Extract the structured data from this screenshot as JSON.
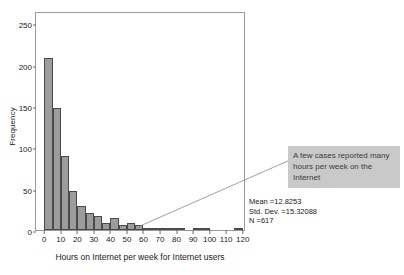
{
  "chart_data": {
    "type": "bar",
    "title": "",
    "xlabel": "Hours on Internet per week for Internet users",
    "ylabel": "Frequency",
    "xlim": [
      -5,
      122
    ],
    "ylim": [
      0,
      265
    ],
    "grid": false,
    "legend": null,
    "bin_width": 5,
    "x_ticks": [
      "0",
      "10",
      "20",
      "30",
      "40",
      "50",
      "60",
      "70",
      "80",
      "90",
      "100",
      "110",
      "120"
    ],
    "x_tick_values": [
      0,
      10,
      20,
      30,
      40,
      50,
      60,
      70,
      80,
      90,
      100,
      110,
      120
    ],
    "y_ticks": [
      "0",
      "50",
      "100",
      "150",
      "200",
      "250"
    ],
    "y_tick_values": [
      0,
      50,
      100,
      150,
      200,
      250
    ],
    "bin_starts": [
      0,
      5,
      10,
      15,
      20,
      25,
      30,
      35,
      40,
      45,
      50,
      55,
      60,
      65,
      70,
      75,
      80,
      85,
      90,
      95,
      100,
      105,
      110,
      115
    ],
    "values": [
      208,
      148,
      90,
      47,
      29,
      20,
      17,
      9,
      15,
      6,
      8,
      6,
      2,
      1,
      3,
      1,
      1,
      0,
      2,
      1,
      0,
      0,
      0,
      1
    ],
    "bars": [
      {
        "bin_start": 0,
        "bin_end": 5,
        "value": 208
      },
      {
        "bin_start": 5,
        "bin_end": 10,
        "value": 148
      },
      {
        "bin_start": 10,
        "bin_end": 15,
        "value": 90
      },
      {
        "bin_start": 15,
        "bin_end": 20,
        "value": 47
      },
      {
        "bin_start": 20,
        "bin_end": 25,
        "value": 29
      },
      {
        "bin_start": 25,
        "bin_end": 30,
        "value": 20
      },
      {
        "bin_start": 30,
        "bin_end": 35,
        "value": 17
      },
      {
        "bin_start": 35,
        "bin_end": 40,
        "value": 9
      },
      {
        "bin_start": 40,
        "bin_end": 45,
        "value": 15
      },
      {
        "bin_start": 45,
        "bin_end": 50,
        "value": 6
      },
      {
        "bin_start": 50,
        "bin_end": 55,
        "value": 8
      },
      {
        "bin_start": 55,
        "bin_end": 60,
        "value": 6
      },
      {
        "bin_start": 60,
        "bin_end": 65,
        "value": 2
      },
      {
        "bin_start": 65,
        "bin_end": 70,
        "value": 1
      },
      {
        "bin_start": 70,
        "bin_end": 75,
        "value": 3
      },
      {
        "bin_start": 75,
        "bin_end": 80,
        "value": 1
      },
      {
        "bin_start": 80,
        "bin_end": 85,
        "value": 1
      },
      {
        "bin_start": 85,
        "bin_end": 90,
        "value": 0
      },
      {
        "bin_start": 90,
        "bin_end": 95,
        "value": 2
      },
      {
        "bin_start": 95,
        "bin_end": 100,
        "value": 1
      },
      {
        "bin_start": 100,
        "bin_end": 105,
        "value": 0
      },
      {
        "bin_start": 105,
        "bin_end": 110,
        "value": 0
      },
      {
        "bin_start": 110,
        "bin_end": 115,
        "value": 0
      },
      {
        "bin_start": 115,
        "bin_end": 120,
        "value": 1
      }
    ],
    "annotations": [
      {
        "name": "callout",
        "text": "A few cases reported many hours per week on the Internet",
        "points_to_x": 60,
        "points_to_y": 5
      }
    ],
    "statistics": {
      "mean_label": "Mean =12.8253",
      "std_dev_label": "Std. Dev. =15.32088",
      "n_label": "N =617",
      "mean": 12.8253,
      "std_dev": 15.32088,
      "n": 617
    },
    "colors": {
      "bar_fill": "#9c9c9c",
      "bar_edge": "#4a4a4a",
      "frame": "#9a9a9a",
      "callout_bg": "#c9c9c9",
      "callout_text": "#3a3a3a",
      "leader_line": "#8a8a8a",
      "text": "#1a1a1a"
    }
  }
}
